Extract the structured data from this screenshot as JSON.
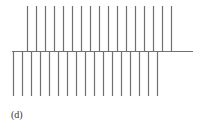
{
  "figure": {
    "label": "(d)",
    "stroke_color": "#707070",
    "axis": {
      "x1": 12,
      "x2": 193,
      "y": 51
    },
    "upper_lines": {
      "count": 17,
      "x_start": 27,
      "spacing": 9,
      "y_top": 6,
      "y_bottom": 51
    },
    "lower_lines": {
      "count": 17,
      "x_start": 13,
      "spacing": 9,
      "y_top": 51,
      "y_bottom": 96
    }
  }
}
